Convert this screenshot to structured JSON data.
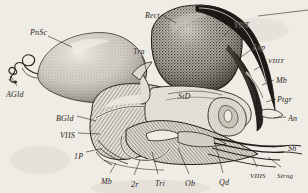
{
  "figure": {
    "title": "Lateral section of insect abdomen and sting apparatus",
    "medium": "stippled line engraving",
    "background_color": "#efece6",
    "ink_color": "#2a2620",
    "width": 308,
    "height": 193
  },
  "labels": [
    {
      "id": "pnsc",
      "text": "PnSc",
      "x": 30,
      "y": 28,
      "note": "poison sac"
    },
    {
      "id": "agld",
      "text": "AGld",
      "x": 6,
      "y": 90,
      "note": "acid gland"
    },
    {
      "id": "tra",
      "text": "Tra",
      "x": 133,
      "y": 47,
      "note": "trachea"
    },
    {
      "id": "rect",
      "text": "Rect",
      "x": 145,
      "y": 11,
      "note": "rectum"
    },
    {
      "id": "viit",
      "text": "VIIT",
      "x": 234,
      "y": 21,
      "note": "seventh tergum"
    },
    {
      "id": "lsp",
      "text": "Lsp",
      "x": 253,
      "y": 43,
      "note": "lateral spiracle plate"
    },
    {
      "id": "viiit",
      "text": "VIIIT",
      "x": 268,
      "y": 57,
      "note": "eighth tergum"
    },
    {
      "id": "mb_r",
      "text": "Mb",
      "x": 276,
      "y": 76,
      "note": "membrane"
    },
    {
      "id": "ptgr",
      "text": "Ptgr",
      "x": 277,
      "y": 95,
      "note": "protractor muscle"
    },
    {
      "id": "an",
      "text": "An",
      "x": 288,
      "y": 114,
      "note": "anus"
    },
    {
      "id": "sh",
      "text": "Sh",
      "x": 288,
      "y": 144,
      "note": "sheath"
    },
    {
      "id": "strng",
      "text": "Strng",
      "x": 277,
      "y": 172,
      "note": "sting"
    },
    {
      "id": "viiis_r",
      "text": "VIIIS",
      "x": 250,
      "y": 172,
      "note": "eighth sternum"
    },
    {
      "id": "qd",
      "text": "Qd",
      "x": 219,
      "y": 178,
      "note": "quadrate plate"
    },
    {
      "id": "ob",
      "text": "Ob",
      "x": 185,
      "y": 179,
      "note": "oblong plate"
    },
    {
      "id": "tri",
      "text": "Tri",
      "x": 155,
      "y": 179,
      "note": "triangular plate"
    },
    {
      "id": "two_r",
      "text": "2r",
      "x": 131,
      "y": 180,
      "note": "second ramus"
    },
    {
      "id": "mb_b",
      "text": "Mb",
      "x": 101,
      "y": 177,
      "note": "membrane"
    },
    {
      "id": "one_p",
      "text": "1P",
      "x": 74,
      "y": 152,
      "note": "first pleurite"
    },
    {
      "id": "viis",
      "text": "VIIS",
      "x": 60,
      "y": 131,
      "note": "seventh sternum"
    },
    {
      "id": "bgld",
      "text": "BGld",
      "x": 56,
      "y": 114,
      "note": "alkaline gland"
    },
    {
      "id": "std",
      "text": "StD",
      "x": 178,
      "y": 92,
      "note": "sting duct"
    }
  ],
  "leaders": [
    {
      "id": "leader-pnsc",
      "from": [
        48,
        36
      ],
      "to": [
        72,
        47
      ]
    },
    {
      "id": "leader-agld",
      "from": [
        17,
        86
      ],
      "to": [
        12,
        78
      ]
    },
    {
      "id": "leader-tra",
      "from": [
        142,
        56
      ],
      "to": [
        147,
        72
      ]
    },
    {
      "id": "leader-rect",
      "from": [
        162,
        15
      ],
      "to": [
        176,
        23
      ]
    },
    {
      "id": "leader-viit",
      "from": [
        232,
        27
      ],
      "to": [
        224,
        36
      ]
    },
    {
      "id": "leader-lsp",
      "from": [
        252,
        49
      ],
      "to": [
        241,
        57
      ]
    },
    {
      "id": "leader-viiit",
      "from": [
        266,
        63
      ],
      "to": [
        254,
        70
      ]
    },
    {
      "id": "leader-mb-r",
      "from": [
        274,
        80
      ],
      "to": [
        262,
        85
      ]
    },
    {
      "id": "leader-ptgr",
      "from": [
        276,
        99
      ],
      "to": [
        266,
        102
      ]
    },
    {
      "id": "leader-an",
      "from": [
        286,
        117
      ],
      "to": [
        274,
        118
      ]
    },
    {
      "id": "leader-sh",
      "from": [
        286,
        146
      ],
      "to": [
        272,
        147
      ]
    },
    {
      "id": "leader-strng",
      "from": [
        281,
        167
      ],
      "to": [
        268,
        157
      ]
    },
    {
      "id": "leader-viiis",
      "from": [
        257,
        167
      ],
      "to": [
        252,
        156
      ]
    },
    {
      "id": "leader-qd",
      "from": [
        223,
        173
      ],
      "to": [
        214,
        139
      ]
    },
    {
      "id": "leader-ob",
      "from": [
        189,
        174
      ],
      "to": [
        178,
        148
      ]
    },
    {
      "id": "leader-tri",
      "from": [
        158,
        174
      ],
      "to": [
        152,
        152
      ]
    },
    {
      "id": "leader-2r",
      "from": [
        134,
        175
      ],
      "to": [
        140,
        160
      ]
    },
    {
      "id": "leader-mb-b",
      "from": [
        110,
        173
      ],
      "to": [
        116,
        163
      ]
    },
    {
      "id": "leader-1p",
      "from": [
        86,
        152
      ],
      "to": [
        100,
        149
      ]
    },
    {
      "id": "leader-viis",
      "from": [
        78,
        133
      ],
      "to": [
        100,
        134
      ]
    },
    {
      "id": "leader-bgld",
      "from": [
        77,
        116
      ],
      "to": [
        96,
        121
      ]
    }
  ],
  "top_rule": {
    "x1": 258,
    "y1": 16,
    "x2": 308,
    "y2": 10
  }
}
